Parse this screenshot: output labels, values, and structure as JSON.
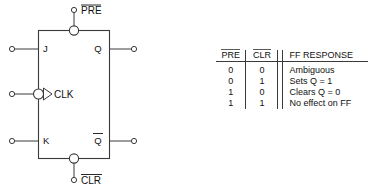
{
  "figure": {
    "inputs": {
      "j_label": "J",
      "k_label": "K",
      "clk_label": "CLK",
      "preset_label": "PRE",
      "clear_label": "CLR"
    },
    "outputs": {
      "q_label": "Q",
      "qbar_label": "Q"
    },
    "notes": {
      "preset_active_low": true,
      "clear_active_low": true,
      "clk_inverted": true,
      "qbar_overline": true
    }
  },
  "table": {
    "headers": {
      "pre": "PRE",
      "clr": "CLR",
      "response": "FF RESPONSE"
    },
    "rows": [
      {
        "pre": "0",
        "clr": "0",
        "response": "Ambiguous"
      },
      {
        "pre": "0",
        "clr": "1",
        "response": "Sets Q = 1"
      },
      {
        "pre": "1",
        "clr": "0",
        "response": "Clears Q = 0"
      },
      {
        "pre": "1",
        "clr": "1",
        "response": "No effect on FF"
      }
    ]
  },
  "colors": {
    "line": "#3a3a3a",
    "text": "#111111",
    "background": "#ffffff"
  }
}
